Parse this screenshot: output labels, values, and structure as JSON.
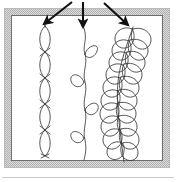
{
  "figure": {
    "caption": "Framed illustration panel showing three vertical quilting stitch motifs, each indicated by an arrow from above.",
    "width": 176,
    "height": 182
  },
  "colors": {
    "page_background": "#ffffff",
    "panel_background": "#ffffff",
    "frame_outer": "#b9b9b9",
    "frame_fill": "#d6d6d6",
    "frame_inner_line": "#6e6e6e",
    "stitch_line": "#3a3a3a",
    "arrow_fill": "#111111",
    "baseline_rule": "#c9c9c9"
  },
  "frame": {
    "name": "illustration-frame",
    "outer": {
      "x": 4,
      "y": 8,
      "width": 166,
      "height": 160
    },
    "band_thickness": 6,
    "inner": {
      "x": 12,
      "y": 16,
      "width": 150,
      "height": 144
    }
  },
  "baseline_rule": {
    "name": "bottom-rule",
    "x1": 2,
    "y1": 177,
    "x2": 174,
    "y2": 177
  },
  "arrows": [
    {
      "id": "arrow-left",
      "label": "arrow-pointing-to-pattern-1",
      "direction": "down-left",
      "tail": {
        "x": 72,
        "y": 2
      },
      "tip": {
        "x": 41,
        "y": 26
      }
    },
    {
      "id": "arrow-middle",
      "label": "arrow-pointing-to-pattern-2",
      "direction": "down",
      "tail": {
        "x": 83,
        "y": 2
      },
      "tip": {
        "x": 83,
        "y": 30
      }
    },
    {
      "id": "arrow-right",
      "label": "arrow-pointing-to-pattern-3",
      "direction": "down-right",
      "tail": {
        "x": 104,
        "y": 3
      },
      "tip": {
        "x": 131,
        "y": 28
      }
    }
  ],
  "patterns": [
    {
      "id": "pattern-chain",
      "name": "chain-lens-stitch-pattern",
      "description": "Vertical chain of elongated lens shapes meeting at pinched crossing points",
      "center_x": 45,
      "top_y": 26,
      "bottom_y": 158,
      "segment_count": 5,
      "segment_height": 26,
      "lens_half_width": 7
    },
    {
      "id": "pattern-loop-vine",
      "name": "looped-vine-stitch-pattern",
      "description": "Wavy vertical stem with single loops alternating left and right",
      "center_x": 86,
      "top_y": 28,
      "bottom_y": 160,
      "loop_count": 4,
      "loop_radius_x": 9,
      "loop_radius_y": 7,
      "loops": [
        {
          "side": "right",
          "y": 50
        },
        {
          "side": "left",
          "y": 80
        },
        {
          "side": "right",
          "y": 108
        },
        {
          "side": "left",
          "y": 136
        }
      ]
    },
    {
      "id": "pattern-feather",
      "name": "feather-plume-stitch-pattern",
      "description": "Curved spine with overlapping teardrop petals arranged on both sides, forming a feather or fern plume",
      "spine_top": {
        "x": 133,
        "y": 27
      },
      "spine_bottom": {
        "x": 124,
        "y": 162
      },
      "petal_pairs": 9,
      "petal_length": 21,
      "petal_width": 13
    }
  ]
}
